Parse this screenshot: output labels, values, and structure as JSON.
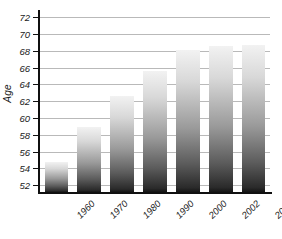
{
  "chart_data": {
    "type": "bar",
    "title": "",
    "xlabel": "",
    "ylabel": "Age",
    "categories": [
      "1960",
      "1970",
      "1980",
      "1990",
      "2000",
      "2002",
      "2003"
    ],
    "values": [
      54.8,
      58.9,
      62.6,
      65.6,
      68.1,
      68.6,
      68.7
    ],
    "ylim": [
      51.2,
      72.6
    ],
    "yticks": [
      52,
      54,
      56,
      58,
      60,
      62,
      64,
      66,
      68,
      70,
      72
    ],
    "ytick_labels": [
      "52",
      "54",
      "56",
      "58",
      "60",
      "62",
      "64",
      "66",
      "68",
      "70",
      "72"
    ],
    "grid": true,
    "grid_axis": "y",
    "legend": null,
    "bar_style": "vertical-gradient-light-top-dark-bottom",
    "colors": {
      "bar_top": "#f2f2f2",
      "bar_bottom": "#141414",
      "gridline": "#b9b9b9",
      "axis": "#101010",
      "text": "#1a1a1a",
      "background": "#ffffff"
    }
  }
}
